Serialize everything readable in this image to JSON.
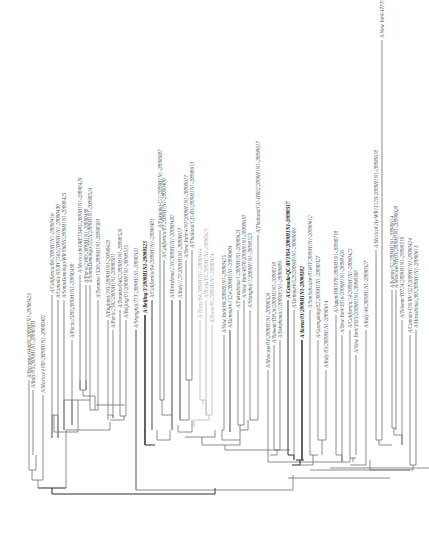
{
  "figure": {
    "type": "phylogenetic-tree",
    "orientation": "root-bottom, leaves-top (labels rotated -90deg)",
    "colors": {
      "branch": "#6e6e6e",
      "branch_dark": "#2a2a2a",
      "branch_light": "#b8b8b8",
      "label": "#555555",
      "label_bold": "#111111",
      "label_light": "#a8a8a8"
    }
  },
  "leaves": [
    {
      "label": "A/Bayonne/6466N/2009H1N1-20090425",
      "x": 29,
      "top": 380,
      "bottom": 449,
      "style": "normal"
    },
    {
      "label": "A/Italy/05/2009H1N1-20090503",
      "x": 33,
      "top": 390,
      "bottom": 455,
      "style": "normal"
    },
    {
      "label": "A/Mexico/4108/2009H1N1-20090402",
      "x": 43,
      "top": 395,
      "bottom": 458,
      "style": "normal"
    },
    {
      "label": "A/California/06/2009H1N1-20090416",
      "x": 52,
      "top": 295,
      "bottom": 438,
      "style": "normal"
    },
    {
      "label": "A/Canada-NS/RV1565/2009H1N1-20090430",
      "x": 58,
      "top": 300,
      "bottom": 438,
      "style": "normal"
    },
    {
      "label": "A/SantoDomingo/WR1068N/2009H1N1-20090425",
      "x": 64,
      "top": 300,
      "bottom": 430,
      "style": "normal"
    },
    {
      "label": "A/Paris/2580/2009H1N1-20090430",
      "x": 72,
      "top": 340,
      "bottom": 425,
      "style": "normal"
    },
    {
      "label": "A/Mexico/InDRE13495/2009H1N1-20090429",
      "x": 80,
      "top": 275,
      "bottom": 390,
      "style": "normal"
    },
    {
      "label": "A/Paris/2390/2009H1N1-20090430",
      "x": 86,
      "top": 285,
      "bottom": 390,
      "style": "normal"
    },
    {
      "label": "A/SantoDomingo/572N/2009H1N1-20090524",
      "x": 90,
      "top": 285,
      "bottom": 410,
      "style": "normal"
    },
    {
      "label": "A/Toronto/1530/2009H1N1-20090503",
      "x": 98,
      "top": 300,
      "bottom": 410,
      "style": "normal"
    },
    {
      "label": "A/England/195/2009H1N1-20090428",
      "x": 108,
      "top": 320,
      "bottom": 415,
      "style": "normal"
    },
    {
      "label": "A/Paris/2592/2009H1N1-20090501",
      "x": 113,
      "top": 330,
      "bottom": 418,
      "style": "normal"
    },
    {
      "label": "A/Toronto/0462/2009H1N1-20090526",
      "x": 120,
      "top": 310,
      "bottom": 416,
      "style": "normal"
    },
    {
      "label": "A/Beijing/01/2009H1N1-20090515",
      "x": 126,
      "top": 320,
      "bottom": 415,
      "style": "normal"
    },
    {
      "label": "A/Shanghai/71T/2009H1N1-20090531",
      "x": 136,
      "top": 330,
      "bottom": 490,
      "style": "normal"
    },
    {
      "label": "A/Beijing/3/2009H1N1-20090523",
      "x": 145,
      "top": 315,
      "bottom": 445,
      "style": "bold"
    },
    {
      "label": "A/California/04/2009H1N1-20090401",
      "x": 152,
      "top": 300,
      "bottom": 430,
      "style": "normal"
    },
    {
      "label": "A/Fukuoka-C/1/2009H1N1-20090607",
      "x": 160,
      "top": 230,
      "bottom": 400,
      "style": "normal"
    },
    {
      "label": "A/California/07/2009H1N1-20090409",
      "x": 164,
      "top": 260,
      "bottom": 400,
      "style": "normal"
    },
    {
      "label": "A/Hiroshima/216/2009H1N1-20090430",
      "x": 172,
      "top": 300,
      "bottom": 430,
      "style": "normal"
    },
    {
      "label": "A/Italy/127/2009H1N1-20090617",
      "x": 180,
      "top": 300,
      "bottom": 420,
      "style": "normal"
    },
    {
      "label": "A/New York/4197/2009H1N1-20090617",
      "x": 186,
      "top": 260,
      "bottom": 380,
      "style": "normal"
    },
    {
      "label": "A/Thailand/CU-B5/2009H1N1-20090613",
      "x": 192,
      "top": 250,
      "bottom": 380,
      "style": "normal"
    },
    {
      "label": "A/Texas/04/2009H1N1-20090414",
      "x": 200,
      "top": 320,
      "bottom": 400,
      "style": "light"
    },
    {
      "label": "A/Texas/05/2009H1N1-20090425",
      "x": 206,
      "top": 300,
      "bottom": 415,
      "style": "light"
    },
    {
      "label": "A/Texas/01/2009H1N1-20090424",
      "x": 212,
      "top": 325,
      "bottom": 415,
      "style": "light"
    },
    {
      "label": "A/New York/06/2009H1N1-20090425",
      "x": 224,
      "top": 335,
      "bottom": 430,
      "style": "normal"
    },
    {
      "label": "A/Denmark/1524/2009H1N1-20090604",
      "x": 230,
      "top": 330,
      "bottom": 432,
      "style": "normal"
    },
    {
      "label": "A/Fukushima/1/2009H1N1-20090623",
      "x": 238,
      "top": 310,
      "bottom": 425,
      "style": "normal"
    },
    {
      "label": "A/New York/4870/2009H1N1-20090610",
      "x": 244,
      "top": 300,
      "bottom": 425,
      "style": "normal"
    },
    {
      "label": "A/Shanghai/1/2009H1N1-20090523",
      "x": 250,
      "top": 310,
      "bottom": 420,
      "style": "normal"
    },
    {
      "label": "A/Thailand/CU-H982/2009H1N1-20090617",
      "x": 258,
      "top": 235,
      "bottom": 410,
      "style": "normal"
    },
    {
      "label": "A/Moscow/03/2009H1N1-20090526",
      "x": 268,
      "top": 370,
      "bottom": 455,
      "style": "normal"
    },
    {
      "label": "A/Taiwan/T0826/2009H1N1-20090710",
      "x": 274,
      "top": 345,
      "bottom": 450,
      "style": "normal"
    },
    {
      "label": "A/Yokohama/1/2009H1N1-20090609",
      "x": 280,
      "top": 340,
      "bottom": 450,
      "style": "normal"
    },
    {
      "label": "A/Canada-QC/RV1954/2009H1N1-20090517",
      "x": 288,
      "top": 300,
      "bottom": 455,
      "style": "bold"
    },
    {
      "label": "A/Denmark/528/2009H1N1-20090609",
      "x": 294,
      "top": 310,
      "bottom": 460,
      "style": "normal"
    },
    {
      "label": "A/Korea/01/2009H1N1-20090502",
      "x": 302,
      "top": 340,
      "bottom": 460,
      "style": "bold"
    },
    {
      "label": "A/SanSalvador/0169T/2009H1N1-20090612",
      "x": 310,
      "top": 310,
      "bottom": 455,
      "style": "normal"
    },
    {
      "label": "A/Guangdong/02/2009H1N1-20090527",
      "x": 318,
      "top": 340,
      "bottom": 440,
      "style": "normal"
    },
    {
      "label": "A/Italy/05/2009H1N1-20090614",
      "x": 326,
      "top": 370,
      "bottom": 440,
      "style": "normal"
    },
    {
      "label": "A/Japan/PR1070/2009H1N1-20090710",
      "x": 336,
      "top": 315,
      "bottom": 455,
      "style": "normal"
    },
    {
      "label": "A/New York/3316/2009H1N1-20090426",
      "x": 342,
      "top": 335,
      "bottom": 462,
      "style": "normal"
    },
    {
      "label": "A/California/14/2009H1N1-20090425",
      "x": 350,
      "top": 330,
      "bottom": 458,
      "style": "normal"
    },
    {
      "label": "A/New York/3335/2009H1N1-20090508",
      "x": 356,
      "top": 355,
      "bottom": 455,
      "style": "normal"
    },
    {
      "label": "A/Italy/49/2009H1N1-20090527",
      "x": 366,
      "top": 330,
      "bottom": 455,
      "style": "normal"
    },
    {
      "label": "A/MexicoCity/WR1312N/2009H1N1-20090610",
      "x": 376,
      "top": 250,
      "bottom": 440,
      "style": "normal"
    },
    {
      "label": "A/New York/4777/2009H1N1-20090614",
      "x": 382,
      "top": 40,
      "bottom": 440,
      "style": "normal"
    },
    {
      "label": "A/Ivanov/52/2009H1N1-20090614",
      "x": 392,
      "top": 290,
      "bottom": 428,
      "style": "normal"
    },
    {
      "label": "A/Moscow/HV05/2009H1N1-20090620",
      "x": 396,
      "top": 290,
      "bottom": 430,
      "style": "normal"
    },
    {
      "label": "A/Taiwan/T0724/2009H1N1-20090519",
      "x": 402,
      "top": 320,
      "bottom": 445,
      "style": "normal"
    },
    {
      "label": "A/Canada-ON/RV1527/2009H1N1-20090424",
      "x": 410,
      "top": 335,
      "bottom": 465,
      "style": "normal"
    },
    {
      "label": "A/Hiroshima/200/2009H1N1-20090613",
      "x": 416,
      "top": 330,
      "bottom": 465,
      "style": "normal"
    }
  ]
}
